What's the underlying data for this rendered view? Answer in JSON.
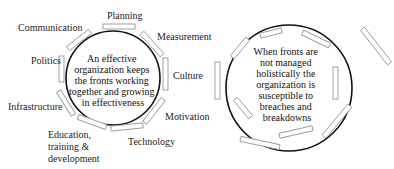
{
  "left_diagram": {
    "center_text": [
      "An effective",
      "organization keeps",
      "the fronts working",
      "together and growing",
      "in effectiveness"
    ],
    "labels": {
      "planning": "Planning",
      "measurement": "Measurement",
      "culture": "Culture",
      "motivation": "Motivation",
      "technology": "Technology",
      "education_1": "Education,",
      "education_2": "training &",
      "education_3": "development",
      "infrastructure": "Infrastructure",
      "politics": "Politics",
      "communication": "Communication"
    }
  },
  "right_diagram": {
    "center_text": [
      "When fronts are",
      "not managed",
      "holistically the",
      "organization is",
      "susceptible to",
      "breaches and",
      "breakdowns"
    ]
  }
}
